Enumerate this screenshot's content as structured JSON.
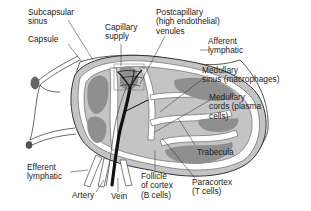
{
  "diagram": {
    "colors": {
      "background": "#ffffff",
      "line": "#333333",
      "capsule_fill": "#ffffff",
      "cortex_fill": "#b5b5b5",
      "follicle_fill": "#8e8e8e",
      "sinus_fill": "#ffffff",
      "vessel": "#111111"
    },
    "labels": {
      "subcapsular_sinus": "Subcapsular\nsinus",
      "capsule": "Capsule",
      "capillary_supply": "Capillary\nsupply",
      "postcapillary_venules": "Postcapillary\n(high endothelial)\nvenules",
      "afferent_lymphatic": "Afferent\nlymphatic",
      "medullary_sinus": "Medullary\nsinus (macrophages)",
      "medullary_cords": "Medullary\ncords (plasma\ncells)",
      "trabecula": "Trabecula",
      "paracortex": "Paracortex\n(T cells)",
      "follicle_of_cortex": "Follicle\nof cortex\n(B cells)",
      "vein": "Vein",
      "artery": "Artery",
      "efferent_lymphatic": "Efferent\nlymphatic"
    }
  }
}
